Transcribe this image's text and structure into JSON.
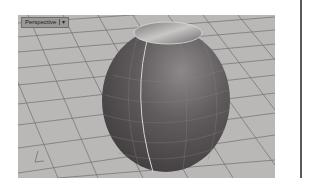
{
  "viewport": {
    "label": "Perspective",
    "label_caret": "▾",
    "background_color": "#b9b8b7",
    "grid_color": "#6e6e6e",
    "object_color": "#5e5a5c",
    "object_highlight": "#d8d6d6",
    "axis_icon": "world-axes-icon"
  }
}
